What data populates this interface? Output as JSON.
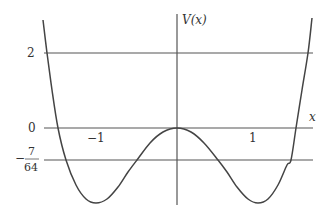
{
  "chart_data": {
    "type": "line",
    "title": "",
    "xlabel": "x",
    "ylabel": "V(x)",
    "function_shape": "symmetric double-well potential with local maximum V(0)=0 and minima at x=±1",
    "x_ticks": [
      {
        "value": -1,
        "label": "−1"
      },
      {
        "value": 1,
        "label": "1"
      }
    ],
    "y_ticks": [
      {
        "value": 2,
        "label": "2"
      },
      {
        "value": 0,
        "label": "0"
      },
      {
        "value": -0.109375,
        "label_sign": "−",
        "label_num": "7",
        "label_den": "64"
      }
    ],
    "horizontal_lines": [
      2,
      0,
      -0.109375
    ],
    "series": [
      {
        "name": "V(x)",
        "points_px": [
          [
            43,
            20
          ],
          [
            47,
            53
          ],
          [
            52,
            90
          ],
          [
            58,
            128
          ],
          [
            66,
            160
          ],
          [
            76,
            185
          ],
          [
            86,
            199
          ],
          [
            96,
            203
          ],
          [
            107,
            199
          ],
          [
            118,
            187
          ],
          [
            128,
            172
          ],
          [
            137,
            160
          ],
          [
            150,
            143
          ],
          [
            163,
            132
          ],
          [
            177,
            128
          ],
          [
            191,
            132
          ],
          [
            204,
            143
          ],
          [
            218,
            160
          ],
          [
            227,
            172
          ],
          [
            237,
            187
          ],
          [
            248,
            199
          ],
          [
            258,
            203
          ],
          [
            268,
            199
          ],
          [
            278,
            185
          ],
          [
            287,
            165
          ],
          [
            291,
            160
          ],
          [
            296,
            128
          ],
          [
            302,
            90
          ],
          [
            308,
            53
          ],
          [
            312,
            18
          ]
        ]
      }
    ],
    "grid": false,
    "legend": "none",
    "color": "#444444"
  },
  "labels": {
    "y_axis": "V(x)",
    "x_axis": "x",
    "tick_2": "2",
    "tick_0": "0",
    "tick_minus": "−",
    "tick_frac_num": "7",
    "tick_frac_den": "64",
    "tick_x_neg1": "−1",
    "tick_x_pos1": "1"
  }
}
